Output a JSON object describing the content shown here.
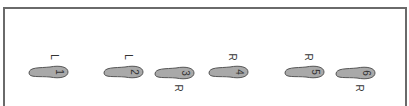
{
  "diagram": {
    "colors": {
      "foot_fill": "#a9a9a9",
      "foot_stroke": "#555555",
      "frame": "#6a6a6a"
    },
    "footprints": [
      {
        "step": "1",
        "side": "L",
        "x": 26,
        "y": 64,
        "label_pos": "above"
      },
      {
        "step": "2",
        "side": "L",
        "x": 101,
        "y": 64,
        "label_pos": "above"
      },
      {
        "step": "3",
        "side": "R",
        "x": 152,
        "y": 95,
        "label_pos": "below"
      },
      {
        "step": "4",
        "side": "R",
        "x": 206,
        "y": 64,
        "label_pos": "above"
      },
      {
        "step": "5",
        "side": "R",
        "x": 282,
        "y": 64,
        "label_pos": "above"
      },
      {
        "step": "6",
        "side": "R",
        "x": 333,
        "y": 95,
        "label_pos": "below"
      }
    ]
  }
}
